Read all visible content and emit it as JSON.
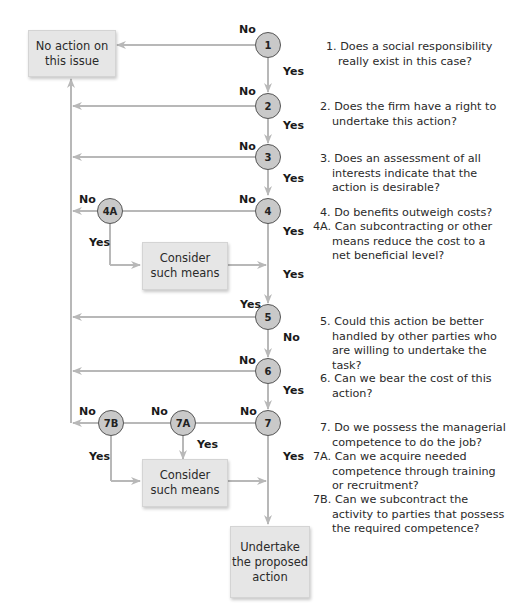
{
  "colors": {
    "line": "#b8b8b8",
    "box_fill": "#e6e6e6",
    "node_fill": "#c9c9c9",
    "node_border": "#555555",
    "text": "#2a2a2a"
  },
  "boxes": {
    "no_action": "No action on\nthis issue",
    "consider_1": "Consider\nsuch means",
    "consider_2": "Consider\nsuch means",
    "undertake": "Undertake\nthe proposed\naction"
  },
  "nodes": {
    "n1": "1",
    "n2": "2",
    "n3": "3",
    "n4": "4",
    "n4a": "4A",
    "n5": "5",
    "n6": "6",
    "n7": "7",
    "n7a": "7A",
    "n7b": "7B"
  },
  "labels": {
    "no_1": "No",
    "yes_1": "Yes",
    "no_2": "No",
    "yes_2": "Yes",
    "no_3": "No",
    "yes_3": "Yes",
    "no_4": "No",
    "yes_4": "Yes",
    "no_4a": "No",
    "yes_4a": "Yes",
    "yes_merge_4": "Yes",
    "yes_5": "Yes",
    "no_5": "No",
    "no_6": "No",
    "yes_6": "Yes",
    "no_7": "No",
    "yes_7": "Yes",
    "no_7a": "No",
    "yes_7a": "Yes",
    "no_7b": "No",
    "yes_7b": "Yes"
  },
  "questions": [
    {
      "num": "1.",
      "lines": [
        "Does a social responsibility",
        "really exist in this case?"
      ]
    },
    {
      "num": "2.",
      "lines": [
        "Does the firm have a right to",
        "undertake this action?"
      ]
    },
    {
      "num": "3.",
      "lines": [
        "Does an assessment of all",
        "interests indicate that the",
        "action is desirable?"
      ]
    },
    {
      "num": "4.",
      "lines": [
        "Do benefits outweigh costs?"
      ]
    },
    {
      "num": "4A.",
      "lines": [
        "Can subcontracting or other",
        "means reduce the cost to a",
        "net beneficial level?"
      ]
    },
    {
      "num": "5.",
      "lines": [
        "Could this action be better",
        "handled by other parties who",
        "are willing to undertake the",
        "task?"
      ]
    },
    {
      "num": "6.",
      "lines": [
        "Can we bear the cost of this",
        "action?"
      ]
    },
    {
      "num": "7.",
      "lines": [
        "Do we possess the managerial",
        "competence to do the job?"
      ]
    },
    {
      "num": "7A.",
      "lines": [
        "Can we acquire needed",
        "competence through training",
        "or recruitment?"
      ]
    },
    {
      "num": "7B.",
      "lines": [
        "Can we subcontract the",
        "activity to parties that possess",
        "the required competence?"
      ]
    }
  ]
}
